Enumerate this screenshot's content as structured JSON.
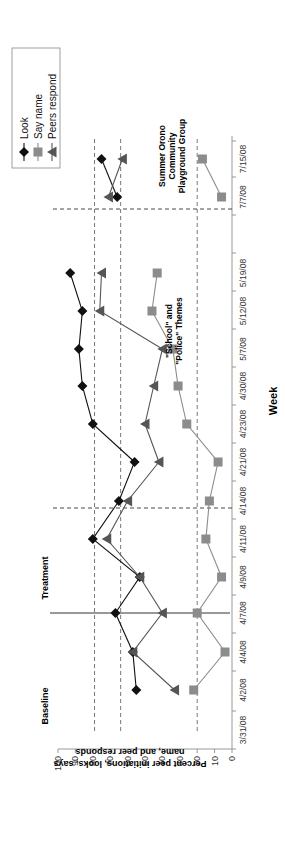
{
  "chart_data": {
    "type": "line",
    "orientation": "rotated -90deg (x-axis on right side, reading bottom-to-top)",
    "title": "",
    "xlabel": "Week",
    "ylabel": "Percent peer initiations, looks, says name, and peer responds",
    "ylim": [
      0,
      100
    ],
    "yticks": [
      0,
      10,
      20,
      30,
      40,
      50,
      60,
      70,
      80,
      90,
      100
    ],
    "categories": [
      "3/31/08",
      "4/2/08",
      "4/4/08",
      "4/7/08",
      "4/9/08",
      "4/11/08",
      "4/14/08",
      "4/21/08",
      "4/23/08",
      "4/30/08",
      "5/7/08",
      "5/12/08",
      "5/19/08",
      "",
      "7/7/08",
      "7/15/08"
    ],
    "series": [
      {
        "name": "Look",
        "marker": "diamond",
        "color": "#111111",
        "segments": [
          {
            "x": [
              "4/2/08",
              "4/4/08",
              "4/7/08",
              "4/9/08",
              "4/11/08",
              "4/14/08",
              "4/21/08",
              "4/23/08",
              "4/30/08",
              "5/7/08",
              "5/12/08",
              "5/19/08"
            ],
            "values": [
              55,
              57,
              67,
              53,
              80,
              65,
              56,
              80,
              86,
              88,
              86,
              93
            ]
          },
          {
            "x": [
              "7/7/08",
              "7/15/08"
            ],
            "values": [
              66,
              75
            ]
          }
        ]
      },
      {
        "name": "Say name",
        "marker": "square",
        "color": "#8c8c8c",
        "segments": [
          {
            "x": [
              "4/2/08",
              "4/4/08",
              "4/7/08",
              "4/9/08",
              "4/11/08",
              "4/14/08",
              "4/21/08",
              "4/23/08",
              "4/30/08",
              "5/7/08",
              "5/12/08",
              "5/19/08"
            ],
            "values": [
              22,
              4,
              20,
              6,
              15,
              13,
              8,
              26,
              31,
              34,
              46,
              43
            ]
          },
          {
            "x": [
              "7/7/08",
              "7/15/08"
            ],
            "values": [
              6,
              17
            ]
          }
        ]
      },
      {
        "name": "Peers respond",
        "marker": "triangle",
        "color": "#555555",
        "segments": [
          {
            "x": [
              "4/2/08",
              "4/4/08",
              "4/7/08",
              "4/9/08",
              "4/11/08",
              "4/14/08",
              "4/21/08",
              "4/23/08",
              "4/30/08",
              "5/7/08",
              "5/12/08",
              "5/19/08"
            ],
            "values": [
              33,
              57,
              40,
              53,
              72,
              60,
              42,
              50,
              45,
              40,
              76,
              75
            ]
          },
          {
            "x": [
              "7/7/08",
              "7/15/08"
            ],
            "values": [
              71,
              63
            ]
          }
        ]
      }
    ],
    "reference_lines_horizontal": [
      79,
      64,
      20
    ],
    "phase_lines": [
      {
        "between": [
          "4/4/08",
          "4/7/08"
        ],
        "style": "solid"
      },
      {
        "between": [
          "4/11/08",
          "4/14/08"
        ],
        "style": "dashed"
      },
      {
        "between": [
          "",
          "7/7/08"
        ],
        "style": "dashed"
      }
    ],
    "annotations": [
      "Baseline",
      "Treatment",
      "\"School\" and \"Police\" Themes",
      "Summer Orono Community Playground Group"
    ],
    "legend": {
      "position": "top-right",
      "entries": [
        "Look",
        "Say name",
        "Peers respond"
      ]
    }
  },
  "labels": {
    "baseline": "Baseline",
    "treatment": "Treatment",
    "themes_line1": "\"School\" and",
    "themes_line2": "\"Police\" Themes",
    "summer_line1": "Summer Orono",
    "summer_line2": "Community",
    "summer_line3": "Playground Group",
    "xlabel": "Week",
    "ylabel_line1": "Percent peer initiations, looks, says",
    "ylabel_line2": "name, and peer responds"
  },
  "legend": [
    "Look",
    "Say name",
    "Peers respond"
  ]
}
